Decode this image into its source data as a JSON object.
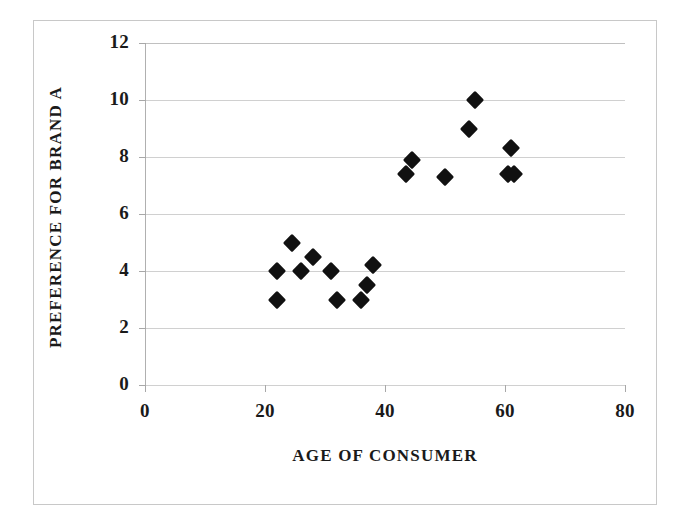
{
  "chart_data": {
    "type": "scatter",
    "title": "",
    "xlabel": "AGE OF CONSUMER",
    "ylabel": "PREFERENCE FOR BRAND A",
    "xlim": [
      0,
      80
    ],
    "ylim": [
      0,
      12
    ],
    "xticks": [
      0,
      20,
      40,
      60,
      80
    ],
    "yticks": [
      0,
      2,
      4,
      6,
      8,
      10,
      12
    ],
    "xtick_labels": [
      "0",
      "20",
      "40",
      "60",
      "80"
    ],
    "ytick_labels": [
      "0",
      "2",
      "4",
      "6",
      "8",
      "10",
      "12"
    ],
    "grid": "horizontal",
    "legend": "none",
    "marker": "filled-diamond",
    "marker_color": "#111111",
    "series": [
      {
        "name": "Consumers",
        "points": [
          {
            "x": 22.0,
            "y": 4.0
          },
          {
            "x": 22.0,
            "y": 3.0
          },
          {
            "x": 24.5,
            "y": 5.0
          },
          {
            "x": 26.0,
            "y": 4.0
          },
          {
            "x": 28.0,
            "y": 4.5
          },
          {
            "x": 31.0,
            "y": 4.0
          },
          {
            "x": 32.0,
            "y": 3.0
          },
          {
            "x": 36.0,
            "y": 3.0
          },
          {
            "x": 37.0,
            "y": 3.5
          },
          {
            "x": 38.0,
            "y": 4.2
          },
          {
            "x": 43.5,
            "y": 7.4
          },
          {
            "x": 44.5,
            "y": 7.9
          },
          {
            "x": 50.0,
            "y": 7.3
          },
          {
            "x": 54.0,
            "y": 9.0
          },
          {
            "x": 55.0,
            "y": 10.0
          },
          {
            "x": 60.5,
            "y": 7.4
          },
          {
            "x": 61.0,
            "y": 8.3
          },
          {
            "x": 61.5,
            "y": 7.4
          }
        ]
      }
    ]
  },
  "figure": {
    "border_color": "#c8c8c8",
    "background": "#ffffff",
    "gridline_color": "#d0d0d0",
    "axis_color": "#b0b0b0"
  }
}
